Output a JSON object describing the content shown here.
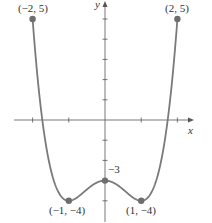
{
  "chart_data": {
    "type": "line",
    "title": "",
    "xlabel": "x",
    "ylabel": "y",
    "xlim": [
      -2.4,
      2.5
    ],
    "ylim": [
      -5,
      5.5
    ],
    "grid": false,
    "function_shape": "quartic with local max at (0,-3) and minima at (±1,-4)",
    "x": [
      -2,
      -1.75,
      -1.5,
      -1.25,
      -1,
      -0.75,
      -0.5,
      -0.25,
      0,
      0.25,
      0.5,
      0.75,
      1,
      1.25,
      1.5,
      1.75,
      2
    ],
    "y": [
      5,
      0.25,
      -2.44,
      -3.69,
      -4,
      -3.81,
      -3.44,
      -3.12,
      -3,
      -3.12,
      -3.44,
      -3.81,
      -4,
      -3.69,
      -2.44,
      0.25,
      5
    ],
    "labeled_points": [
      {
        "x": -2,
        "y": 5,
        "label": "(−2, 5)"
      },
      {
        "x": 2,
        "y": 5,
        "label": "(2, 5)"
      },
      {
        "x": -1,
        "y": -4,
        "label": "(−1, −4)"
      },
      {
        "x": 1,
        "y": -4,
        "label": "(1, −4)"
      },
      {
        "x": 0,
        "y": -3,
        "label": "−3"
      }
    ],
    "x_ticks": [
      -2,
      -1,
      1,
      2
    ],
    "y_ticks": [
      -4,
      -3,
      -2,
      -1,
      1,
      2,
      3,
      4,
      5
    ]
  },
  "labels": {
    "x_axis": "x",
    "y_axis": "y",
    "p_left_top": "(−2, 5)",
    "p_right_top": "(2, 5)",
    "p_left_min": "(−1, −4)",
    "p_right_min": "(1, −4)",
    "p_center": "−3"
  },
  "colors": {
    "curve": "#7a7a7a",
    "axis": "#555555",
    "point": "#6e6e6e"
  }
}
